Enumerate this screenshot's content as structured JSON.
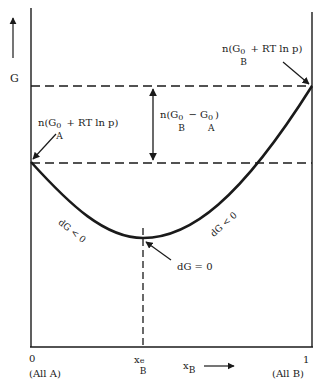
{
  "figure": {
    "y_axis_label": "G",
    "x_axis_label_main": "x",
    "x_axis_label_sub": "B",
    "x_ticks": [
      {
        "value": "0",
        "caption": "(All A)"
      },
      {
        "value": "1",
        "caption": "(All B)"
      }
    ],
    "equilibrium_tick": {
      "main": "x",
      "sub": "B",
      "sup": "e"
    },
    "annotations": {
      "left_endpoint": {
        "prefix": "n(G",
        "sup": "0",
        "sub": "A",
        "suffix": " + RT ln p)"
      },
      "right_endpoint": {
        "prefix": "n(G",
        "sup": "0",
        "sub": "B",
        "suffix": " + RT ln p)"
      },
      "difference": {
        "prefix": "n(G",
        "sup1": "0",
        "sub1": "B",
        "mid": " − G",
        "sup2": "0",
        "sub2": "A",
        "suffix": ")"
      },
      "left_slope": "dG < 0",
      "right_slope": "dG < 0",
      "minimum": "dG = 0"
    },
    "colors": {
      "line": "#1a1a1a",
      "background": "#ffffff"
    }
  }
}
